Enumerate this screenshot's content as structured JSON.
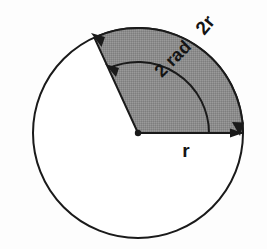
{
  "figure": {
    "background_color": "#fdfdfd",
    "stroke_color": "#1a1a1a",
    "sector_fill_color": "#8a8a8a",
    "circle_fill_color": "#ffffff"
  },
  "geometry": {
    "center_x": 138,
    "center_y": 133,
    "outer_radius": 105,
    "inner_radius": 71,
    "sector_start_angle_deg": 0,
    "sector_end_angle_deg": 114.59,
    "sector_angle_radians": 2
  },
  "labels": {
    "outer_arc": {
      "text": "2r",
      "x": 210,
      "y": 29,
      "rotation_deg": -50,
      "font_size": 19
    },
    "inner_arc": {
      "text": "2 rad",
      "x": 177,
      "y": 63,
      "rotation_deg": -45,
      "font_size": 18
    },
    "radius": {
      "text": "r",
      "x": 186,
      "y": 157,
      "rotation_deg": 0,
      "font_size": 19
    }
  },
  "markers": {
    "center_dot_radius": 3.2,
    "arrow_outer_arc_start": "arrowhead pointing down at right end of outer arc",
    "arrow_outer_arc_end": "arrowhead pointing up-left at top end of outer arc",
    "arrow_inner_arc_end": "arrowhead pointing left along inner arc",
    "arrow_radius_end": "arrowhead pointing right at end of radius line"
  }
}
